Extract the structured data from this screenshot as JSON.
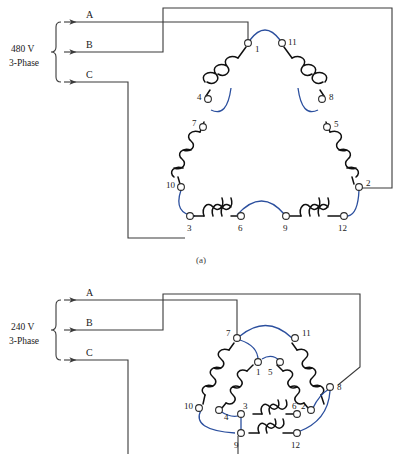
{
  "figure": {
    "caption_a": "(a)",
    "caption_b": "(b)"
  },
  "diagram_a": {
    "source": {
      "voltage": "480 V",
      "phase": "3-Phase",
      "lines": [
        {
          "name": "A",
          "label": "A"
        },
        {
          "name": "B",
          "label": "B"
        },
        {
          "name": "C",
          "label": "C"
        }
      ]
    },
    "connection_type": "series delta",
    "terminals": [
      {
        "id": "1",
        "label": "1"
      },
      {
        "id": "11",
        "label": "11"
      },
      {
        "id": "4",
        "label": "4"
      },
      {
        "id": "8",
        "label": "8"
      },
      {
        "id": "7",
        "label": "7"
      },
      {
        "id": "5",
        "label": "5"
      },
      {
        "id": "10",
        "label": "10"
      },
      {
        "id": "2",
        "label": "2"
      },
      {
        "id": "3",
        "label": "3"
      },
      {
        "id": "6",
        "label": "6"
      },
      {
        "id": "9",
        "label": "9"
      },
      {
        "id": "12",
        "label": "12"
      }
    ],
    "line_connections": [
      {
        "line": "A",
        "terminal": "1"
      },
      {
        "line": "B",
        "terminal": "2"
      },
      {
        "line": "C",
        "terminal": "3"
      }
    ],
    "jumpers": [
      {
        "from": "1",
        "to": "11"
      },
      {
        "from": "4",
        "to": "7"
      },
      {
        "from": "8",
        "to": "5"
      },
      {
        "from": "10",
        "to": "3"
      },
      {
        "from": "6",
        "to": "9"
      },
      {
        "from": "12",
        "to": "2"
      }
    ],
    "coils": [
      {
        "from": "1",
        "to": "4"
      },
      {
        "from": "11",
        "to": "8"
      },
      {
        "from": "7",
        "to": "10"
      },
      {
        "from": "5",
        "to": "2"
      },
      {
        "from": "3",
        "to": "6"
      },
      {
        "from": "9",
        "to": "12"
      }
    ]
  },
  "diagram_b": {
    "source": {
      "voltage": "240 V",
      "phase": "3-Phase",
      "lines": [
        {
          "name": "A",
          "label": "A"
        },
        {
          "name": "B",
          "label": "B"
        },
        {
          "name": "C",
          "label": "C"
        }
      ]
    },
    "connection_type": "parallel delta",
    "terminals": [
      {
        "id": "7",
        "label": "7"
      },
      {
        "id": "11",
        "label": "11"
      },
      {
        "id": "1",
        "label": "1"
      },
      {
        "id": "5",
        "label": "5"
      },
      {
        "id": "10",
        "label": "10"
      },
      {
        "id": "8",
        "label": "8"
      },
      {
        "id": "4",
        "label": "4"
      },
      {
        "id": "2",
        "label": "2"
      },
      {
        "id": "3",
        "label": "3"
      },
      {
        "id": "6",
        "label": "6"
      },
      {
        "id": "9",
        "label": "9"
      },
      {
        "id": "12",
        "label": "12"
      }
    ],
    "line_connections": [
      {
        "line": "A",
        "terminal": "7"
      },
      {
        "line": "B",
        "terminal": "8"
      },
      {
        "line": "C",
        "terminal": "9"
      }
    ],
    "jumpers": [
      {
        "from": "7",
        "to": "11"
      },
      {
        "from": "7",
        "to": "1"
      },
      {
        "from": "8",
        "to": "2"
      },
      {
        "from": "8",
        "to": "12"
      },
      {
        "from": "10",
        "to": "9"
      },
      {
        "from": "4",
        "to": "3"
      },
      {
        "from": "3",
        "to": "9"
      }
    ],
    "coils": [
      {
        "from": "7",
        "to": "10"
      },
      {
        "from": "11",
        "to": "8"
      },
      {
        "from": "1",
        "to": "4"
      },
      {
        "from": "5",
        "to": "2"
      },
      {
        "from": "3",
        "to": "6"
      },
      {
        "from": "9",
        "to": "12"
      }
    ]
  },
  "colors": {
    "wire": "#3a3a3a",
    "coil": "#101010",
    "jumper": "#2b4f9e",
    "terminal_fill": "#ffffff",
    "background": "#ffffff"
  }
}
